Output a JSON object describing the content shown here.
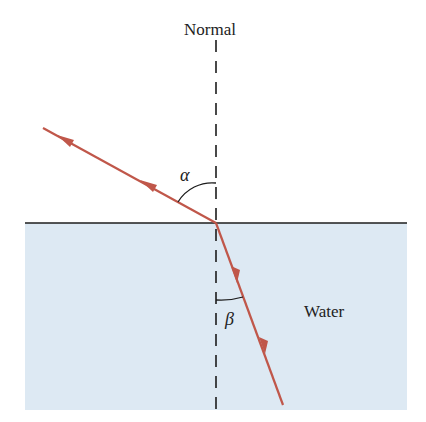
{
  "labels": {
    "normal": "Normal",
    "water": "Water",
    "alpha": "α",
    "beta": "β"
  },
  "colors": {
    "water": "#dde9f3",
    "ray": "#c0574a",
    "interface": "#1c1c1c",
    "normal_line": "#1c1c1c",
    "text": "#222222"
  },
  "geometry": {
    "incidence_point": [
      216,
      223
    ],
    "incident_start": [
      43,
      128
    ],
    "refracted_end": [
      283,
      405
    ],
    "water_rect": [
      25,
      223,
      407,
      410
    ]
  }
}
